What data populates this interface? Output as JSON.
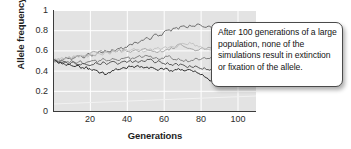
{
  "chart_data": {
    "type": "line",
    "title": "",
    "xlabel": "Generations",
    "ylabel": "Allele frequency",
    "xlim": [
      0,
      110
    ],
    "ylim": [
      0,
      1
    ],
    "grid": true,
    "legend_position": "none",
    "xticks": [
      20,
      40,
      60,
      80,
      100
    ],
    "yticks": [
      0,
      0.2,
      0.4,
      0.6,
      0.8,
      1
    ],
    "xtick_labels": [
      "20",
      "40",
      "60",
      "80",
      "100"
    ],
    "ytick_labels": [
      "0",
      "0.2",
      "0.4",
      "0.6",
      "0.8",
      "1"
    ],
    "annotation": "After 100 generations of a large population, none of the simulations result in extinction or fixation of the allele.",
    "x": [
      0,
      2,
      4,
      6,
      8,
      10,
      12,
      14,
      16,
      18,
      20,
      22,
      24,
      26,
      28,
      30,
      32,
      34,
      36,
      38,
      40,
      42,
      44,
      46,
      48,
      50,
      52,
      54,
      56,
      58,
      60,
      62,
      64,
      66,
      68,
      70,
      72,
      74,
      76,
      78,
      80,
      82,
      84,
      86,
      88,
      90,
      92,
      94,
      96,
      98,
      100
    ],
    "series": [
      {
        "name": "simulation-1",
        "color": "#6e6e6e",
        "values": [
          0.5,
          0.5,
          0.49,
          0.51,
          0.52,
          0.51,
          0.53,
          0.54,
          0.53,
          0.55,
          0.56,
          0.55,
          0.57,
          0.58,
          0.6,
          0.59,
          0.61,
          0.6,
          0.62,
          0.61,
          0.63,
          0.66,
          0.68,
          0.67,
          0.7,
          0.72,
          0.71,
          0.74,
          0.76,
          0.75,
          0.78,
          0.8,
          0.79,
          0.82,
          0.81,
          0.84,
          0.83,
          0.85,
          0.84,
          0.86,
          0.85,
          0.83,
          0.84,
          0.82,
          0.81,
          0.79,
          0.8,
          0.78,
          0.79,
          0.8,
          0.79
        ]
      },
      {
        "name": "simulation-2",
        "color": "#a8a8a8",
        "values": [
          0.5,
          0.51,
          0.5,
          0.52,
          0.53,
          0.52,
          0.54,
          0.55,
          0.54,
          0.56,
          0.57,
          0.59,
          0.58,
          0.6,
          0.59,
          0.58,
          0.6,
          0.59,
          0.61,
          0.6,
          0.59,
          0.58,
          0.6,
          0.59,
          0.61,
          0.62,
          0.6,
          0.59,
          0.58,
          0.6,
          0.59,
          0.61,
          0.63,
          0.62,
          0.66,
          0.65,
          0.63,
          0.62,
          0.61,
          0.6,
          0.62,
          0.61,
          0.63,
          0.62,
          0.64,
          0.63,
          0.65,
          0.64,
          0.66,
          0.65,
          0.66
        ]
      },
      {
        "name": "simulation-3",
        "color": "#808080",
        "values": [
          0.5,
          0.49,
          0.5,
          0.48,
          0.49,
          0.5,
          0.48,
          0.49,
          0.47,
          0.48,
          0.49,
          0.5,
          0.48,
          0.5,
          0.51,
          0.5,
          0.52,
          0.51,
          0.5,
          0.52,
          0.53,
          0.51,
          0.52,
          0.54,
          0.53,
          0.55,
          0.54,
          0.52,
          0.53,
          0.51,
          0.52,
          0.54,
          0.53,
          0.51,
          0.52,
          0.5,
          0.51,
          0.49,
          0.5,
          0.52,
          0.51,
          0.53,
          0.52,
          0.54,
          0.53,
          0.55,
          0.54,
          0.56,
          0.55,
          0.57,
          0.56
        ]
      },
      {
        "name": "simulation-4",
        "color": "#585858",
        "values": [
          0.5,
          0.49,
          0.48,
          0.49,
          0.47,
          0.48,
          0.47,
          0.46,
          0.47,
          0.46,
          0.45,
          0.46,
          0.47,
          0.46,
          0.48,
          0.47,
          0.49,
          0.48,
          0.47,
          0.49,
          0.48,
          0.5,
          0.49,
          0.48,
          0.5,
          0.49,
          0.51,
          0.5,
          0.48,
          0.49,
          0.47,
          0.48,
          0.46,
          0.47,
          0.45,
          0.46,
          0.44,
          0.45,
          0.43,
          0.44,
          0.42,
          0.43,
          0.41,
          0.42,
          0.4,
          0.41,
          0.4,
          0.39,
          0.4,
          0.39,
          0.38
        ]
      },
      {
        "name": "simulation-5",
        "color": "#2e2e2e",
        "values": [
          0.5,
          0.49,
          0.48,
          0.47,
          0.46,
          0.45,
          0.44,
          0.45,
          0.43,
          0.44,
          0.42,
          0.41,
          0.4,
          0.38,
          0.36,
          0.38,
          0.4,
          0.42,
          0.41,
          0.43,
          0.42,
          0.44,
          0.43,
          0.45,
          0.44,
          0.43,
          0.42,
          0.43,
          0.41,
          0.42,
          0.41,
          0.42,
          0.4,
          0.41,
          0.42,
          0.41,
          0.4,
          0.41,
          0.39,
          0.38,
          0.36,
          0.34,
          0.32,
          0.3,
          0.31,
          0.29,
          0.3,
          0.28,
          0.29,
          0.28,
          0.27
        ]
      },
      {
        "name": "simulation-6",
        "color": "#c4c4c4",
        "values": [
          0.5,
          0.51,
          0.52,
          0.51,
          0.53,
          0.52,
          0.54,
          0.53,
          0.55,
          0.54,
          0.56,
          0.55,
          0.57,
          0.56,
          0.58,
          0.57,
          0.59,
          0.58,
          0.6,
          0.59,
          0.61,
          0.6,
          0.62,
          0.61,
          0.6,
          0.59,
          0.61,
          0.6,
          0.62,
          0.61,
          0.63,
          0.62,
          0.64,
          0.63,
          0.65,
          0.67,
          0.66,
          0.68,
          0.67,
          0.65,
          0.64,
          0.62,
          0.61,
          0.6,
          0.61,
          0.6,
          0.62,
          0.61,
          0.6,
          0.61,
          0.6
        ]
      }
    ]
  },
  "axis": {
    "y_title": "Allele frequency",
    "x_title": "Generations"
  }
}
